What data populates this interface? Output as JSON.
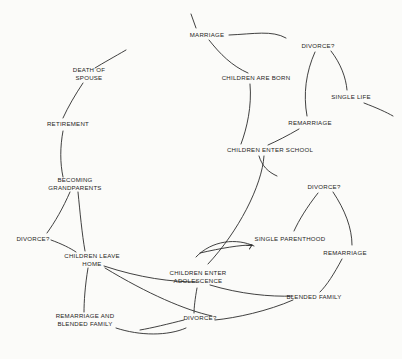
{
  "document": {
    "title": "Family Life Cycle Flow Diagram",
    "background_color": "#fbfbf9",
    "stroke_color": "#2b2b2b",
    "text_color": "#1d1d1d"
  },
  "nodes": [
    {
      "id": "marriage",
      "label": "MARRIAGE",
      "x": 207,
      "y": 35
    },
    {
      "id": "divorce-1",
      "label": "DIVORCE?",
      "x": 318,
      "y": 46
    },
    {
      "id": "children-are-born",
      "label": "CHILDREN ARE BORN",
      "x": 256,
      "y": 78
    },
    {
      "id": "single-life",
      "label": "SINGLE LIFE",
      "x": 351,
      "y": 97
    },
    {
      "id": "death-of-spouse",
      "label": "DEATH OF\nSPOUSE",
      "x": 89,
      "y": 74
    },
    {
      "id": "remarriage-1",
      "label": "REMARRIAGE",
      "x": 310,
      "y": 123
    },
    {
      "id": "retirement",
      "label": "RETIREMENT",
      "x": 68,
      "y": 124
    },
    {
      "id": "children-enter-school",
      "label": "CHILDREN ENTER SCHOOL",
      "x": 270,
      "y": 150
    },
    {
      "id": "becoming-grandparents",
      "label": "BECOMING\nGRANDPARENTS",
      "x": 75,
      "y": 184
    },
    {
      "id": "divorce-2",
      "label": "DIVORCE?",
      "x": 324,
      "y": 187
    },
    {
      "id": "single-parenthood",
      "label": "SINGLE PARENTHOOD",
      "x": 290,
      "y": 239
    },
    {
      "id": "divorce-3",
      "label": "DIVORCE?",
      "x": 33,
      "y": 239
    },
    {
      "id": "remarriage-2",
      "label": "REMARRIAGE",
      "x": 345,
      "y": 253
    },
    {
      "id": "children-leave-home",
      "label": "CHILDREN LEAVE\nHOME",
      "x": 92,
      "y": 260
    },
    {
      "id": "children-enter-adol",
      "label": "CHILDREN ENTER\nADOLESCENCE",
      "x": 198,
      "y": 277
    },
    {
      "id": "blended-family",
      "label": "BLENDED FAMILY",
      "x": 314,
      "y": 297
    },
    {
      "id": "remarriage-blended",
      "label": "REMARRIAGE AND\nBLENDED FAMILY",
      "x": 85,
      "y": 320
    },
    {
      "id": "divorce-4",
      "label": "DIVORCE?",
      "x": 200,
      "y": 318
    }
  ],
  "edges": [
    {
      "id": "edge-into-marriage",
      "from": "cycle-return",
      "to": "marriage",
      "d": "M 191 14 L 196 28"
    },
    {
      "id": "edge-marriage-to-divorce1",
      "from": "marriage",
      "to": "divorce-1",
      "d": "M 229 35 C 254 34 272 30 286 38"
    },
    {
      "id": "edge-marriage-to-children-born",
      "from": "marriage",
      "to": "children-are-born",
      "d": "M 209 40 C 220 54 232 66 248 73"
    },
    {
      "id": "edge-divorce1-to-single-life",
      "from": "divorce-1",
      "to": "single-life",
      "d": "M 331 51 C 341 64 346 78 347 90"
    },
    {
      "id": "edge-divorce1-to-remarriage1",
      "from": "divorce-1",
      "to": "remarriage-1",
      "d": "M 315 52 C 306 72 303 94 307 116"
    },
    {
      "id": "edge-single-life-out",
      "from": "single-life",
      "to": "cycle-exit",
      "d": "M 364 103 C 377 108 386 112 393 116"
    },
    {
      "id": "edge-children-born-to-school",
      "from": "children-are-born",
      "to": "children-enter-school",
      "d": "M 250 84 C 252 106 247 128 241 144"
    },
    {
      "id": "edge-remarriage1-to-school",
      "from": "remarriage-1",
      "to": "children-enter-school",
      "d": "M 299 129 C 287 136 277 141 268 145"
    },
    {
      "id": "edge-death-to-retirement",
      "from": "death-of-spouse",
      "to": "retirement",
      "d": "M 83 83 C 75 95 68 107 63 118"
    },
    {
      "id": "edge-marriage-top-return",
      "from": "cycle-top",
      "to": "death-of-spouse",
      "d": "M 126 50 C 114 57 103 63 95 68"
    },
    {
      "id": "edge-retirement-to-grandparents",
      "from": "retirement",
      "to": "becoming-grandparents",
      "d": "M 63 131 C 60 147 60 163 63 177"
    },
    {
      "id": "edge-school-down-a",
      "from": "children-enter-school",
      "to": "divorce-2",
      "d": "M 259 156 C 262 166 268 172 277 176"
    },
    {
      "id": "edge-school-down-b",
      "from": "children-enter-school",
      "to": "children-enter-adol",
      "d": "M 264 156 C 262 186 238 232 208 264"
    },
    {
      "id": "edge-divorce2-to-single-parent",
      "from": "divorce-2",
      "to": "single-parenthood",
      "d": "M 318 193 C 307 207 299 220 294 231"
    },
    {
      "id": "edge-divorce2-to-remarriage2",
      "from": "divorce-2",
      "to": "remarriage-2",
      "d": "M 333 192 C 345 210 352 228 352 245"
    },
    {
      "id": "edge-grandparents-to-divorce3",
      "from": "becoming-grandparents",
      "to": "divorce-3",
      "d": "M 70 192 C 63 208 55 222 47 233"
    },
    {
      "id": "edge-grandparents-to-leave-home",
      "from": "becoming-grandparents",
      "to": "children-leave-home",
      "d": "M 78 192 C 80 212 82 234 85 251"
    },
    {
      "id": "edge-divorce3-to-leave-home",
      "from": "divorce-3",
      "to": "children-leave-home",
      "d": "M 51 240 C 62 244 70 248 76 252"
    },
    {
      "id": "edge-adol-arc-to-single-parent",
      "from": "children-enter-adol",
      "to": "single-parenthood",
      "d": "M 196 257 C 212 240 237 238 254 246"
    },
    {
      "id": "edge-left-arc-to-single-parent",
      "from": "cycle-left",
      "to": "single-parenthood",
      "d": "M 200 253 C 222 248 240 245 252 245"
    },
    {
      "id": "edge-remarriage2-to-blended",
      "from": "remarriage-2",
      "to": "blended-family",
      "d": "M 342 259 C 334 274 327 285 320 292"
    },
    {
      "id": "edge-leave-home-to-adol",
      "from": "children-leave-home",
      "to": "children-enter-adol",
      "d": "M 104 266 C 140 278 172 282 197 282"
    },
    {
      "id": "edge-leave-home-to-remarriage-bl",
      "from": "children-leave-home",
      "to": "remarriage-blended",
      "d": "M 88 268 C 85 286 84 302 84 312"
    },
    {
      "id": "edge-leave-home-long-arc",
      "from": "children-leave-home",
      "to": "divorce-4",
      "d": "M 105 268 C 148 294 185 310 212 316"
    },
    {
      "id": "edge-adol-to-divorce4",
      "from": "children-enter-adol",
      "to": "divorce-4",
      "d": "M 197 288 C 195 299 194 308 194 313"
    },
    {
      "id": "edge-adol-to-blended",
      "from": "children-enter-adol",
      "to": "blended-family",
      "d": "M 210 285 C 240 294 270 297 293 296"
    },
    {
      "id": "edge-blended-bottom-arc",
      "from": "blended-family",
      "to": "cycle-bottom",
      "d": "M 293 300 C 268 311 236 318 215 320"
    },
    {
      "id": "edge-remarriage-bl-to-bottom",
      "from": "remarriage-blended",
      "to": "cycle-bottom",
      "d": "M 116 328 C 140 336 168 336 186 328"
    },
    {
      "id": "edge-divorce4-to-bottom",
      "from": "divorce-4",
      "to": "cycle-bottom",
      "d": "M 184 320 C 168 324 152 328 140 330"
    }
  ],
  "arrowheads": [
    {
      "id": "arrow-single-parenthood",
      "x": 252,
      "y": 245,
      "angle": -28
    }
  ]
}
